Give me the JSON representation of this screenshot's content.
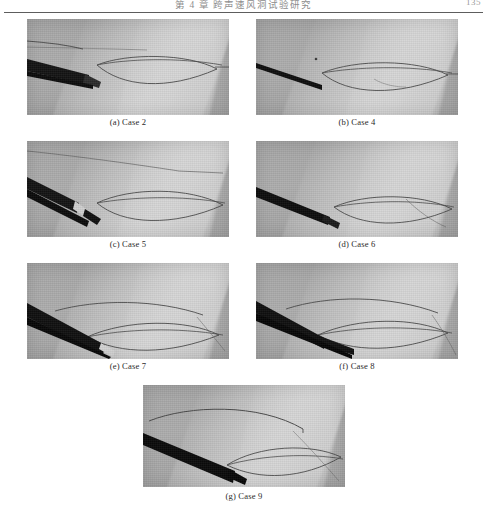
{
  "header": {
    "running_title": "第 4 章  跨声速风洞试验研究",
    "page_number": "135"
  },
  "figure": {
    "panels": [
      {
        "id": "panel-case-2",
        "caption": "(a) Case 2",
        "row": 1,
        "column": "left",
        "image_kind": "schlieren-photograph",
        "alt": "Schlieren photograph of airfoil with dark blunt probe at leading edge"
      },
      {
        "id": "panel-case-4",
        "caption": "(b) Case 4",
        "row": 1,
        "column": "right",
        "image_kind": "schlieren-photograph",
        "alt": "Schlieren photograph of airfoil with thin slender probe"
      },
      {
        "id": "panel-case-5",
        "caption": "(c) Case 5",
        "row": 2,
        "column": "left",
        "image_kind": "schlieren-photograph",
        "alt": "Schlieren photograph of airfoil with tapered probe and bright tip"
      },
      {
        "id": "panel-case-6",
        "caption": "(d) Case 6",
        "row": 2,
        "column": "right",
        "image_kind": "schlieren-photograph",
        "alt": "Schlieren photograph of airfoil with inclined probe and shock wave"
      },
      {
        "id": "panel-case-7",
        "caption": "(e) Case 7",
        "row": 3,
        "column": "left",
        "image_kind": "schlieren-photograph",
        "alt": "Schlieren photograph of airfoil with thick inclined probe"
      },
      {
        "id": "panel-case-8",
        "caption": "(f) Case 8",
        "row": 3,
        "column": "right",
        "image_kind": "schlieren-photograph",
        "alt": "Schlieren photograph of airfoil with probe and trailing shock"
      },
      {
        "id": "panel-case-9",
        "caption": "(g) Case 9",
        "row": 4,
        "column": "center",
        "image_kind": "schlieren-photograph",
        "alt": "Schlieren photograph of airfoil with large dark wedge probe"
      }
    ]
  }
}
